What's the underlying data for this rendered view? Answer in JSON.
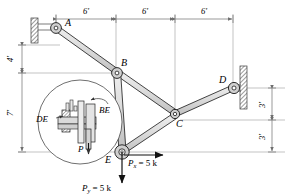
{
  "figure": {
    "type": "engineering-free-body-diagram"
  },
  "joints": {
    "a": {
      "label": "A",
      "x": 56,
      "y": 29
    },
    "b": {
      "label": "B",
      "x": 117,
      "y": 73
    },
    "c": {
      "label": "C",
      "x": 175,
      "y": 115
    },
    "d": {
      "label": "D",
      "x": 233,
      "y": 88
    },
    "e": {
      "label": "E",
      "x": 122,
      "y": 152
    }
  },
  "dimensions": {
    "horizontal": [
      {
        "label": "6'",
        "from_x": 56,
        "to_x": 116,
        "y": 19
      },
      {
        "label": "6'",
        "from_x": 116,
        "to_x": 175,
        "y": 19
      },
      {
        "label": "6'",
        "from_x": 175,
        "to_x": 233,
        "y": 19
      }
    ],
    "vertical_left": [
      {
        "label": "4'",
        "from_y": 45,
        "to_y": 73,
        "x": 22
      },
      {
        "label": "7'",
        "from_y": 73,
        "to_y": 152,
        "x": 22
      }
    ],
    "vertical_right": [
      {
        "label": "3'",
        "from_y": 88,
        "to_y": 120,
        "x": 272
      },
      {
        "label": "3'",
        "from_y": 120,
        "to_y": 152,
        "x": 272
      }
    ]
  },
  "loads": {
    "px": {
      "label": "P",
      "subscript": "x",
      "equals": "= 5 k",
      "full": "Px = 5 k",
      "direction": "right",
      "magnitude": 5,
      "units": "k"
    },
    "py": {
      "label": "P",
      "subscript": "y",
      "equals": "= 5 k",
      "full": "Py = 5 k",
      "direction": "down",
      "magnitude": 5,
      "units": "k"
    }
  },
  "detail_inset": {
    "member_de_label": "DE",
    "member_be_label": "BE",
    "pin_label": "P",
    "center_x": 80,
    "center_y": 122,
    "radius": 42
  },
  "supports": {
    "left_wall": {
      "name": "fixed-wall-support-a",
      "x": 32,
      "y": 18,
      "w": 7,
      "h": 24
    },
    "right_wall": {
      "name": "fixed-wall-support-d",
      "x": 240,
      "y": 67,
      "w": 7,
      "h": 42
    }
  },
  "colors": {
    "member_fill": "#d8d8d8",
    "member_stroke": "#1a1a1a",
    "dimension_line": "#777777",
    "hatch": "#555555",
    "text": "#000000",
    "inset_circle": "#444444"
  }
}
